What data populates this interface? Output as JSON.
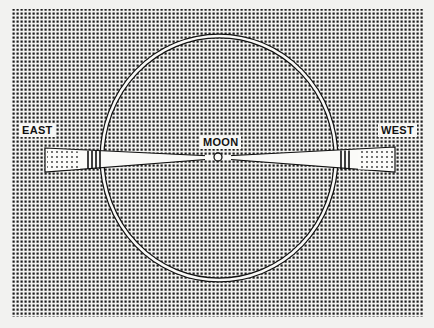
{
  "diagram": {
    "background_color": "#f2f2f0",
    "stipple_color": "#1c1c1c",
    "field": {
      "x": 12,
      "y": 9,
      "width": 412,
      "height": 308
    },
    "circle": {
      "cx": 219,
      "cy": 158,
      "rx": 117,
      "ry": 122
    },
    "moon": {
      "cx": 218,
      "cy": 157,
      "r": 4
    },
    "labels": {
      "east": "EAST",
      "moon": "MOON",
      "west": "WEST"
    }
  }
}
